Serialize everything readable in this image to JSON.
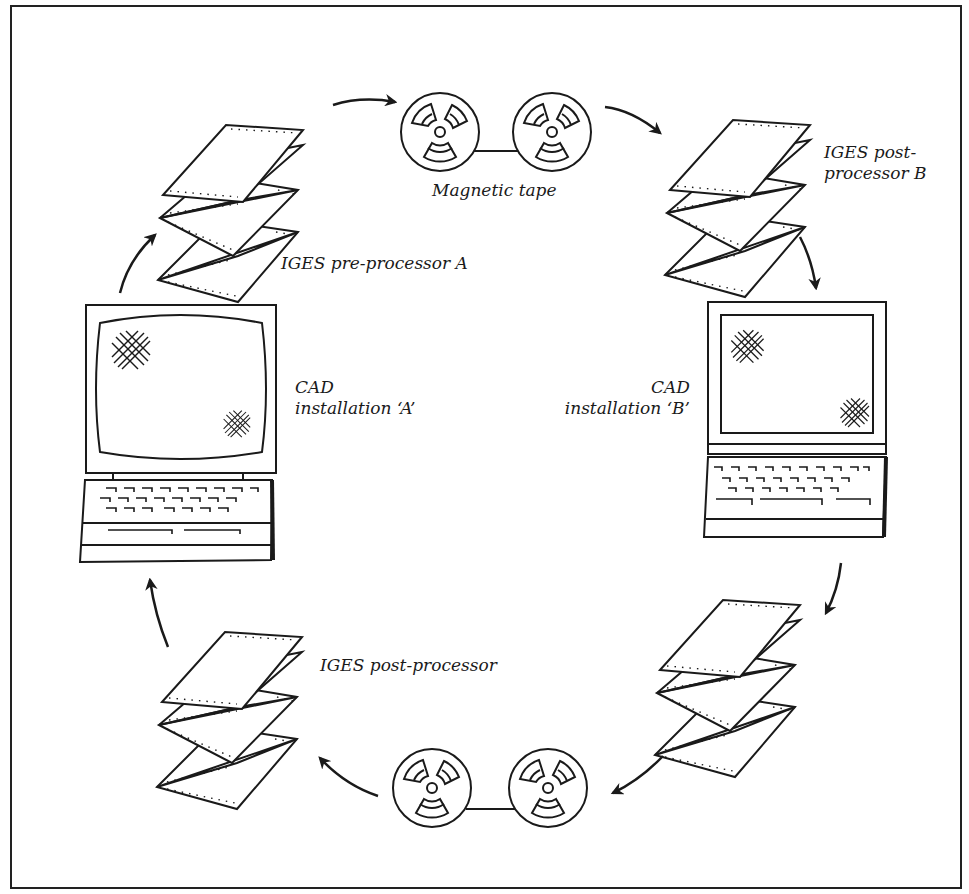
{
  "diagram": {
    "type": "cycle",
    "colors": {
      "ink": "#1a1a1a",
      "background": "#ffffff"
    },
    "nodes": [
      {
        "id": "cad_a",
        "kind": "computer-desktop",
        "label_line1": "CAD",
        "label_line2": "installation ‘A’"
      },
      {
        "id": "pre_a",
        "kind": "fanfold-paper",
        "label": "IGES pre-processor A"
      },
      {
        "id": "tape_top",
        "kind": "magnetic-tape",
        "label": "Magnetic tape"
      },
      {
        "id": "post_b",
        "kind": "fanfold-paper",
        "label_line1": "IGES post-",
        "label_line2": "processor B"
      },
      {
        "id": "cad_b",
        "kind": "computer-laptop",
        "label_line1": "CAD",
        "label_line2": "installation ‘B’"
      },
      {
        "id": "pre_b",
        "kind": "fanfold-paper",
        "label": ""
      },
      {
        "id": "tape_bottom",
        "kind": "magnetic-tape",
        "label": ""
      },
      {
        "id": "post_a",
        "kind": "fanfold-paper",
        "label": "IGES post-processor"
      }
    ],
    "edges": [
      {
        "from": "cad_a",
        "to": "pre_a"
      },
      {
        "from": "pre_a",
        "to": "tape_top"
      },
      {
        "from": "tape_top",
        "to": "post_b"
      },
      {
        "from": "post_b",
        "to": "cad_b"
      },
      {
        "from": "cad_b",
        "to": "pre_b"
      },
      {
        "from": "pre_b",
        "to": "tape_bottom"
      },
      {
        "from": "tape_bottom",
        "to": "post_a"
      },
      {
        "from": "post_a",
        "to": "cad_a"
      }
    ]
  }
}
